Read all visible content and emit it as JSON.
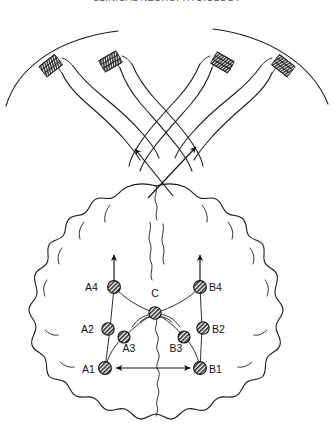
{
  "header": {
    "title": "CLINICAL NEUROPHYSIOLOGY"
  },
  "figure": {
    "name": "somatosensory-cortex-crossed-hands-diagram",
    "caption_labels": {
      "a4": "A4",
      "b4": "B4",
      "c": "C",
      "a2": "A2",
      "b2": "B2",
      "a3": "A3",
      "b3": "B3",
      "a1": "A1",
      "b1": "B1"
    },
    "colors": {
      "ink": "#1a1a1a",
      "node_fill": "#9a9a9a",
      "background": "#ffffff"
    },
    "nodes": [
      {
        "id": "A4",
        "label": "A4",
        "x": 114,
        "y": 287,
        "label_x": 87,
        "label_y": 288,
        "anchor": "start"
      },
      {
        "id": "B4",
        "label": "B4",
        "x": 200,
        "y": 287,
        "label_x": 209,
        "label_y": 288,
        "anchor": "start"
      },
      {
        "id": "C",
        "label": "C",
        "x": 155,
        "y": 313,
        "label_x": 155,
        "label_y": 298,
        "anchor": "middle"
      },
      {
        "id": "A2",
        "label": "A2",
        "x": 108,
        "y": 329,
        "label_x": 83,
        "label_y": 330,
        "anchor": "start"
      },
      {
        "id": "B2",
        "label": "B2",
        "x": 203,
        "y": 328,
        "label_x": 211,
        "label_y": 330,
        "anchor": "start"
      },
      {
        "id": "A3",
        "label": "A3",
        "x": 124,
        "y": 337,
        "label_x": 124,
        "label_y": 351,
        "anchor": "middle"
      },
      {
        "id": "B3",
        "label": "B3",
        "x": 184,
        "y": 337,
        "label_x": 179,
        "label_y": 351,
        "anchor": "middle"
      },
      {
        "id": "A1",
        "label": "A1",
        "x": 105,
        "y": 368,
        "label_x": 84,
        "label_y": 369,
        "anchor": "start"
      },
      {
        "id": "B1",
        "label": "B1",
        "x": 200,
        "y": 368,
        "label_x": 209,
        "label_y": 369,
        "anchor": "start"
      }
    ],
    "hands_count": 4,
    "arrow_pairs": [
      {
        "from": "left-hemisphere",
        "to": "right-arm"
      },
      {
        "from": "right-hemisphere",
        "to": "left-arm"
      }
    ],
    "bidirectional_link": {
      "from": "A1",
      "to": "B1"
    }
  }
}
